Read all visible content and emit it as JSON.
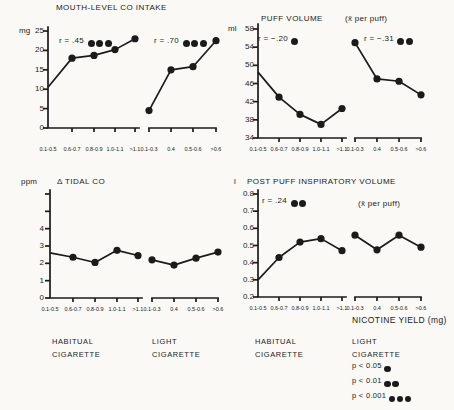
{
  "colors": {
    "ink": "#1b1b1b",
    "paper": "#faf9f6"
  },
  "nicotine_axis_label": "NICOTINE YIELD (mg)",
  "group_labels": [
    {
      "line1": "HABITUAL",
      "line2": "CIGARETTE"
    },
    {
      "line1": "LIGHT",
      "line2": "CIGARETTE"
    },
    {
      "line1": "HABITUAL",
      "line2": "CIGARETTE"
    },
    {
      "line1": "LIGHT",
      "line2": "CIGARETTE"
    }
  ],
  "legend": {
    "items": [
      {
        "label": "p < 0.05",
        "dots": 1
      },
      {
        "label": "p < 0.01",
        "dots": 2
      },
      {
        "label": "p < 0.001",
        "dots": 3
      }
    ]
  },
  "chart_data": [
    {
      "type": "line",
      "title": "MOUTH-LEVEL CO INTAKE",
      "unit": "mg",
      "subtitle": "",
      "ylim": [
        0,
        25
      ],
      "yticks": [
        {
          "v": 0,
          "label": "0"
        },
        {
          "v": 5,
          "label": "5"
        },
        {
          "v": 10,
          "label": "10"
        },
        {
          "v": 15,
          "label": "15"
        },
        {
          "v": 20,
          "label": "20"
        },
        {
          "v": 25,
          "label": "25"
        }
      ],
      "series": [
        {
          "name": "habitual cigarette",
          "r_label": "r = .45",
          "r_dots": 3,
          "marker_on_first": false,
          "categories": [
            "0.1-0.5",
            "0.6-0.7",
            "0.8-0.9",
            "1.0-1.1",
            ">1.1"
          ],
          "values": [
            10.5,
            18,
            18.7,
            20.2,
            23
          ]
        },
        {
          "name": "light cigarette",
          "r_label": "r = .70",
          "r_dots": 3,
          "marker_on_first": true,
          "categories": [
            "0.1-0.3",
            "0.4",
            "0.5-0.6",
            ">0.6"
          ],
          "values": [
            4.5,
            15,
            15.8,
            22.5
          ]
        }
      ]
    },
    {
      "type": "line",
      "title": "PUFF VOLUME",
      "unit": "ml",
      "subtitle": "(x̄ per puff)",
      "ylim": [
        34,
        58
      ],
      "yticks": [
        {
          "v": 34,
          "label": "34"
        },
        {
          "v": 38,
          "label": "38"
        },
        {
          "v": 42,
          "label": "42"
        },
        {
          "v": 46,
          "label": "46"
        },
        {
          "v": 50,
          "label": "50"
        },
        {
          "v": 54,
          "label": "54"
        },
        {
          "v": 58,
          "label": "58"
        }
      ],
      "series": [
        {
          "name": "habitual cigarette",
          "r_label": "r = −.20",
          "r_dots": 1,
          "marker_on_first": false,
          "categories": [
            "0.1-0.5",
            "0.6-0.7",
            "0.8-0.9",
            "1.0-1.1",
            ">1.1"
          ],
          "values": [
            48.5,
            43,
            39.2,
            37,
            40.5
          ]
        },
        {
          "name": "light cigarette",
          "r_label": "r = −.31",
          "r_dots": 2,
          "marker_on_first": true,
          "categories": [
            "0.1-0.3",
            "0.4",
            "0.5-0.6",
            ">0.6"
          ],
          "values": [
            55,
            47,
            46.5,
            43.5
          ]
        }
      ]
    },
    {
      "type": "line",
      "title": "Δ TIDAL CO",
      "unit": "ppm",
      "subtitle": "",
      "ylim": [
        0,
        6
      ],
      "yticks": [
        {
          "v": 0,
          "label": "0"
        },
        {
          "v": 1,
          "label": "1"
        },
        {
          "v": 2,
          "label": "2"
        },
        {
          "v": 3,
          "label": "3"
        },
        {
          "v": 4,
          "label": "4"
        },
        {
          "v": 5,
          "label": ""
        },
        {
          "v": 6,
          "label": ""
        }
      ],
      "series": [
        {
          "name": "habitual cigarette",
          "r_label": "",
          "r_dots": 0,
          "marker_on_first": false,
          "categories": [
            "0.1-0.5",
            "0.6-0.7",
            "0.8-0.9",
            "1.0-1.1",
            ">1.1"
          ],
          "values": [
            2.6,
            2.35,
            2.05,
            2.75,
            2.45
          ]
        },
        {
          "name": "light cigarette",
          "r_label": "",
          "r_dots": 0,
          "marker_on_first": true,
          "categories": [
            "0.1-0.3",
            "0.4",
            "0.5-0.6",
            ">0.6"
          ],
          "values": [
            2.2,
            1.9,
            2.3,
            2.65
          ]
        }
      ]
    },
    {
      "type": "line",
      "title": "POST PUFF INSPIRATORY VOLUME",
      "unit": "l",
      "subtitle": "(x̄ per puff)",
      "ylim": [
        0.2,
        0.8
      ],
      "yticks": [
        {
          "v": 0.2,
          "label": "0.2"
        },
        {
          "v": 0.3,
          "label": "0.3"
        },
        {
          "v": 0.4,
          "label": "0.4"
        },
        {
          "v": 0.5,
          "label": "0.5"
        },
        {
          "v": 0.6,
          "label": "0.6"
        },
        {
          "v": 0.7,
          "label": "0.7"
        },
        {
          "v": 0.8,
          "label": "0.8"
        }
      ],
      "series": [
        {
          "name": "habitual cigarette",
          "r_label": "r = .24",
          "r_dots": 2,
          "marker_on_first": false,
          "categories": [
            "0.1-0.5",
            "0.6-0.7",
            "0.8-0.9",
            "1.0-1.1",
            ">1.1"
          ],
          "values": [
            0.3,
            0.43,
            0.52,
            0.54,
            0.47
          ]
        },
        {
          "name": "light cigarette",
          "r_label": "",
          "r_dots": 0,
          "marker_on_first": true,
          "categories": [
            "0.1-0.3",
            "0.4",
            "0.5-0.6",
            ">0.6"
          ],
          "values": [
            0.56,
            0.475,
            0.56,
            0.49
          ]
        }
      ]
    }
  ]
}
